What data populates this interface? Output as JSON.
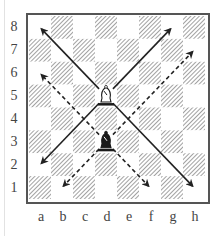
{
  "diagram": {
    "ranks": [
      "8",
      "7",
      "6",
      "5",
      "4",
      "3",
      "2",
      "1"
    ],
    "files": [
      "a",
      "b",
      "c",
      "d",
      "e",
      "f",
      "g",
      "h"
    ],
    "colors": {
      "light_square": "#ffffff",
      "dark_square_hatch": "#8a8a8a",
      "frame": "#555555",
      "arrow": "#222222"
    },
    "pieces": [
      {
        "type": "bishop",
        "color": "white",
        "square": "d5"
      },
      {
        "type": "bishop",
        "color": "black",
        "square": "d3"
      }
    ],
    "arrows": [
      {
        "from": "d5",
        "to": "a8",
        "style": "solid"
      },
      {
        "from": "d5",
        "to": "g8",
        "style": "solid"
      },
      {
        "from": "d5",
        "to": "a2",
        "style": "solid"
      },
      {
        "from": "d5",
        "to": "h1",
        "style": "solid"
      },
      {
        "from": "d3",
        "to": "a6",
        "style": "dashed"
      },
      {
        "from": "d3",
        "to": "h7",
        "style": "dashed"
      },
      {
        "from": "d3",
        "to": "b1",
        "style": "dashed"
      },
      {
        "from": "d3",
        "to": "f1",
        "style": "dashed"
      }
    ]
  }
}
